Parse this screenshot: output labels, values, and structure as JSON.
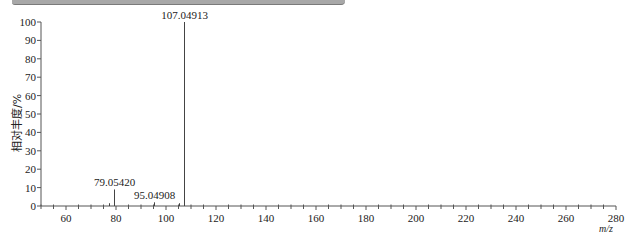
{
  "chart_data": {
    "type": "bar",
    "subtype": "mass-spectrum-stick",
    "title": "",
    "xlabel": "m/z",
    "ylabel": "相对丰度/%",
    "xlim": [
      50,
      280
    ],
    "ylim": [
      0,
      100
    ],
    "x_major_ticks": [
      60,
      80,
      100,
      120,
      140,
      160,
      180,
      200,
      220,
      240,
      260,
      280
    ],
    "x_minor_step": 5,
    "y_ticks": [
      0,
      10,
      20,
      30,
      40,
      50,
      60,
      70,
      80,
      90,
      100
    ],
    "grid": false,
    "peaks": [
      {
        "mz": 77.04,
        "intensity": 1.5,
        "label": ""
      },
      {
        "mz": 79.0542,
        "intensity": 9,
        "label": "79.05420"
      },
      {
        "mz": 95.04908,
        "intensity": 2,
        "label": "95.04908"
      },
      {
        "mz": 105.03,
        "intensity": 1.5,
        "label": ""
      },
      {
        "mz": 107.04913,
        "intensity": 100,
        "label": "107.04913"
      }
    ]
  }
}
